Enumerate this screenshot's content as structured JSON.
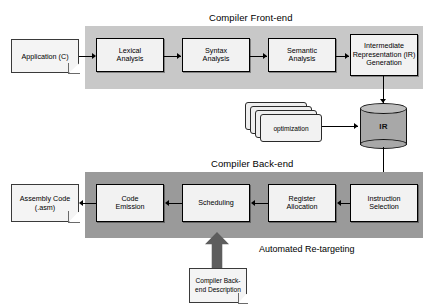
{
  "diagram": {
    "sections": {
      "front_end": {
        "title": "Compiler Front-end",
        "band_color": "#c8c8c8",
        "stages": [
          {
            "id": "lexical",
            "lines": [
              "Lexical",
              "Analysis"
            ]
          },
          {
            "id": "syntax",
            "lines": [
              "Syntax",
              "Analysis"
            ]
          },
          {
            "id": "semantic",
            "lines": [
              "Semantic",
              "Analysis"
            ]
          },
          {
            "id": "ir-generation",
            "lines": [
              "Intermediate",
              "Representation (IR)",
              "Generation"
            ]
          }
        ]
      },
      "back_end": {
        "title": "Compiler Back-end",
        "band_color": "#9a9a9a",
        "stages": [
          {
            "id": "code-emission",
            "lines": [
              "Code",
              "Emission"
            ]
          },
          {
            "id": "scheduling",
            "lines": [
              "Scheduling"
            ]
          },
          {
            "id": "register-allocation",
            "lines": [
              "Register",
              "Allocation"
            ]
          },
          {
            "id": "instruction-selection",
            "lines": [
              "Instruction",
              "Selection"
            ]
          }
        ]
      }
    },
    "documents": {
      "application": {
        "lines": [
          "Application",
          "(C)"
        ]
      },
      "assembly_output": {
        "lines": [
          "Assembly",
          "Code",
          "(.asm)"
        ]
      },
      "backend_description": {
        "lines": [
          "Compiler",
          "Back-end",
          "Description"
        ]
      }
    },
    "store": {
      "ir_label": "IR",
      "fill_color": "#a8a8a8"
    },
    "optimization_stack": {
      "label": "optimization",
      "sheet_count": 4
    },
    "retargeting": {
      "label": "Automated Re-targeting",
      "arrow_color": "#5d5d5d"
    }
  }
}
